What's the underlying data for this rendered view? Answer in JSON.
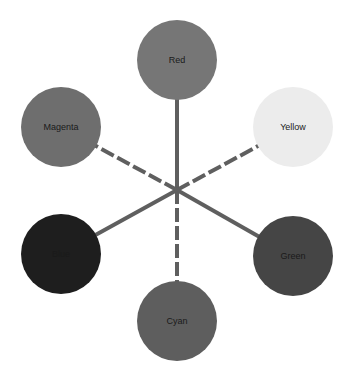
{
  "diagram": {
    "type": "color-wheel-star",
    "hub": {
      "x": 177,
      "y": 190
    },
    "line_color": "#5f5f5f",
    "line_width": 4,
    "dash_pattern": "14 4",
    "node_radius": 40,
    "nodes": [
      {
        "id": "red",
        "label": "Red",
        "x": 177,
        "y": 60,
        "fill": "#767676",
        "label_color": "#1a1a1a",
        "edge_style": "solid"
      },
      {
        "id": "yellow",
        "label": "Yellow",
        "x": 293,
        "y": 127,
        "fill": "#ececec",
        "label_color": "#333333",
        "edge_style": "dashed"
      },
      {
        "id": "green",
        "label": "Green",
        "x": 293,
        "y": 256,
        "fill": "#454545",
        "label_color": "#111111",
        "edge_style": "solid"
      },
      {
        "id": "cyan",
        "label": "Cyan",
        "x": 177,
        "y": 321,
        "fill": "#5e5e5e",
        "label_color": "#1a1a1a",
        "edge_style": "dashed"
      },
      {
        "id": "blue",
        "label": "Blue",
        "x": 61,
        "y": 254,
        "fill": "#1e1e1e",
        "label_color": "#3a3a3a",
        "edge_style": "solid"
      },
      {
        "id": "magenta",
        "label": "Magenta",
        "x": 61,
        "y": 127,
        "fill": "#6e6e6e",
        "label_color": "#1a1a1a",
        "edge_style": "dashed"
      }
    ]
  }
}
